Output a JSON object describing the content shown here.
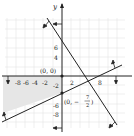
{
  "figure": {
    "type": "system-of-inequalities-graph",
    "axes": {
      "x_label": "",
      "y_label": "y",
      "x_tick_labels": [
        "-8",
        "-6",
        "-4",
        "-2",
        "2",
        "8"
      ],
      "y_tick_labels": [
        "6",
        "4",
        "-2",
        "-6",
        "-8"
      ],
      "x_range": [
        -10,
        11
      ],
      "y_range": [
        -12,
        12
      ]
    },
    "points": [
      {
        "label": "(0, 0)",
        "x": 0,
        "y": 0
      },
      {
        "label_prefix": "(0, −",
        "fraction_num": "7",
        "fraction_den": "2",
        "label_suffix": ")",
        "x": 0,
        "y": -3.5
      }
    ],
    "lines": [
      {
        "name": "steep-line",
        "slope_sign": "negative",
        "y_intercept": 7.5,
        "x_intercept": 5.5
      },
      {
        "name": "shallow-line",
        "slope_sign": "positive",
        "y_intercept": -3.5
      }
    ],
    "boundaries": [
      {
        "name": "x-axis-boundary",
        "description": "y ≥ 0 style boundary with downward arrows"
      },
      {
        "name": "y-axis-boundary",
        "description": "x ≤ 0 style boundary with leftward arrows"
      }
    ],
    "shaded_region": "third quadrant above shallow line",
    "colors": {
      "grid": "#d8d8d8",
      "axis": "#222222",
      "line": "#222222",
      "shade": "#e4e4e4"
    }
  }
}
